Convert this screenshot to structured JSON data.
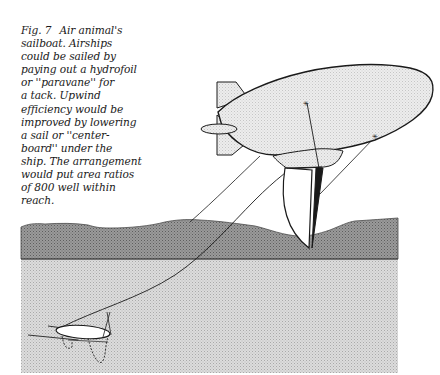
{
  "figure": {
    "label": "Fig. 7",
    "caption_lines": [
      "Air animal's",
      "sailboat. Airships",
      "could be sailed by",
      "paying out a hydrofoil",
      "or ''paravane'' for",
      "a tack. Upwind",
      "efficiency would be",
      "improved by lowering",
      "a sail or ''center-",
      "board'' under the",
      "ship. The arrangement",
      "would put area ratios",
      "of 800 well within",
      "reach."
    ],
    "illustration": {
      "subject": "airship towing hydrofoil (paravane) with centerboard sail",
      "elements": [
        "airship-envelope",
        "tail-fins",
        "gondola",
        "centerboard-sail",
        "tow-line",
        "hydrofoil-paravane",
        "land-band",
        "sea-area"
      ],
      "colors": {
        "envelope_fill": "#e6e6e6",
        "outline": "#1a1a1a",
        "land": "#8c8c8c",
        "sea": "#d4d4d4",
        "sail_fill": "#ffffff"
      }
    }
  }
}
